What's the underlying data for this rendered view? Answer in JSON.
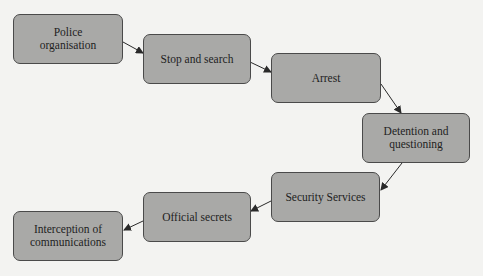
{
  "diagram": {
    "type": "flowchart",
    "colors": {
      "background": "#f3f3f1",
      "node_fill": "#a9a9a7",
      "node_border": "#4a4a4a",
      "text": "#1e1e1e",
      "arrow": "#2a2a2a"
    },
    "nodes": [
      {
        "id": "police",
        "label": "Police organisation"
      },
      {
        "id": "stop",
        "label": "Stop and search"
      },
      {
        "id": "arrest",
        "label": "Arrest"
      },
      {
        "id": "detention",
        "label": "Detention and questioning"
      },
      {
        "id": "security",
        "label": "Security Services"
      },
      {
        "id": "secrets",
        "label": "Official secrets"
      },
      {
        "id": "interception",
        "label": "Interception of communications"
      }
    ],
    "edges": [
      {
        "from": "police",
        "to": "stop"
      },
      {
        "from": "stop",
        "to": "arrest"
      },
      {
        "from": "arrest",
        "to": "detention"
      },
      {
        "from": "detention",
        "to": "security"
      },
      {
        "from": "security",
        "to": "secrets"
      },
      {
        "from": "secrets",
        "to": "interception"
      }
    ]
  }
}
